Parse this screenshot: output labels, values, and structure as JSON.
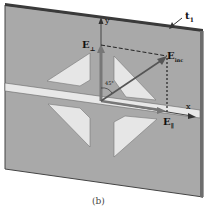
{
  "figure": {
    "caption": "(b)",
    "labels": {
      "thickness": "t",
      "thickness_sub": "1",
      "y_axis": "y",
      "x_axis": "x",
      "e_perp": "E",
      "e_perp_sub": "⊥",
      "e_inc": "E",
      "e_inc_sub": "inc",
      "e_par": "E",
      "e_par_sub": "∥",
      "angle": "45°"
    },
    "colors": {
      "plate": "#a9a9a9",
      "plate_edge": "#3c3c3c",
      "slot": "#e6e6e6",
      "arrow": "#5a5a5a",
      "background": "#ffffff"
    }
  }
}
